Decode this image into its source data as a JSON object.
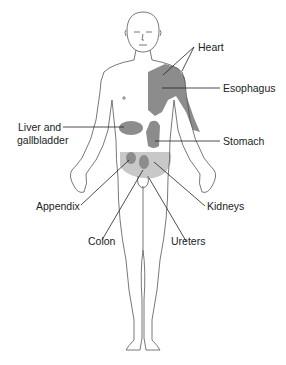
{
  "diagram": {
    "type": "anatomical referred pain map",
    "colors": {
      "dark_region": "#8c8c8c",
      "light_region": "#c8c8c8",
      "outline": "#555555",
      "leader": "#222222"
    },
    "labels": {
      "heart": "Heart",
      "esophagus": "Esophagus",
      "liver": "Liver and\ngallbladder",
      "liver_line1": "Liver and",
      "liver_line2": "gallbladder",
      "stomach": "Stomach",
      "appendix": "Appendix",
      "kidneys": "Kidneys",
      "colon": "Colon",
      "ureters": "Ureters"
    }
  }
}
